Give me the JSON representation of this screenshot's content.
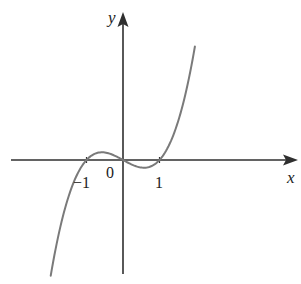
{
  "chart_data": {
    "type": "line",
    "title": "",
    "function": "y = x^3 - x",
    "xlabel": "x",
    "ylabel": "y",
    "x_tick_labels": [
      "-1",
      "0",
      "1"
    ],
    "x_ticks": [
      -1,
      0,
      1
    ],
    "roots": [
      -1,
      0,
      1
    ],
    "local_max": {
      "x": -0.577,
      "y": 0.385
    },
    "local_min": {
      "x": 0.577,
      "y": -0.385
    },
    "xlim": [
      -3.1,
      4.7
    ],
    "x_domain_plotted": [
      -1.98,
      1.97
    ],
    "grid": false,
    "legend": false,
    "series": [
      {
        "name": "curve",
        "color": "#7a7a7a",
        "x": [
          -1.98,
          -1.75,
          -1.5,
          -1.25,
          -1.0,
          -0.75,
          -0.577,
          -0.25,
          0,
          0.25,
          0.577,
          0.75,
          1.0,
          1.25,
          1.5,
          1.75,
          1.97
        ],
        "y": [
          -5.78,
          -3.61,
          -1.88,
          -0.7,
          0,
          0.33,
          0.385,
          0.23,
          0,
          -0.23,
          -0.385,
          -0.33,
          0,
          0.7,
          1.88,
          3.61,
          5.68
        ]
      }
    ]
  },
  "labels": {
    "x_axis": "x",
    "y_axis": "y",
    "origin": "0",
    "tick_neg1": "−1",
    "tick_pos1": "1"
  },
  "colors": {
    "axis": "#2f2f2f",
    "curve": "#7a7a7a",
    "background": "#ffffff"
  }
}
